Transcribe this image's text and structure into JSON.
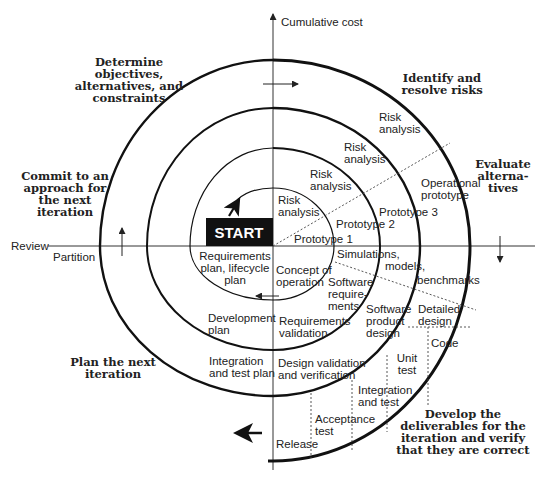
{
  "axes": {
    "vertical_label": "Cumulative cost",
    "left_label_above": "Review",
    "left_label_below": "Partition"
  },
  "quadrants": {
    "top_left": [
      "Determine",
      "objectives,",
      "alternatives, and",
      "constraints"
    ],
    "top_right": [
      "Identify and",
      "resolve risks"
    ],
    "right": [
      "Evaluate",
      "alterna-",
      "tives"
    ],
    "left": [
      "Commit to an",
      "approach for",
      "the next",
      "iteration"
    ],
    "bottom_left": [
      "Plan the next",
      "iteration"
    ],
    "bottom_right": [
      "Develop the",
      "deliverables for the",
      "iteration and verify",
      "that they are correct"
    ]
  },
  "start_label": "START",
  "risk_analysis": [
    [
      "Risk",
      "analysis"
    ],
    [
      "Risk",
      "analysis"
    ],
    [
      "Risk",
      "analysis"
    ],
    [
      "Risk",
      "analysis"
    ]
  ],
  "prototypes": [
    "Prototype 1",
    "Prototype 2",
    "Prototype 3"
  ],
  "operational_prototype": [
    "Operational",
    "prototype"
  ],
  "simulations": [
    "Simulations,",
    "models,",
    "benchmarks"
  ],
  "plans": {
    "requirements": [
      "Requirements",
      "plan, lifecycle",
      "plan"
    ],
    "development": [
      "Development",
      "plan"
    ],
    "integration": [
      "Integration",
      "and test plan"
    ]
  },
  "development_steps": {
    "concept": [
      "Concept of",
      "operation"
    ],
    "software_requirements": [
      "Software",
      "require-",
      "ments"
    ],
    "requirements_validation": [
      "Requirements",
      "validation"
    ],
    "software_product_design": [
      "Software",
      "product",
      "design"
    ],
    "design_validation": [
      "Design validation",
      "and verification"
    ],
    "detailed_design": [
      "Detailed",
      "design"
    ],
    "code": "Code",
    "unit_test": [
      "Unit",
      "test"
    ],
    "integration_test": [
      "Integration",
      "and test"
    ],
    "acceptance_test": [
      "Acceptance",
      "test"
    ],
    "release": "Release"
  }
}
